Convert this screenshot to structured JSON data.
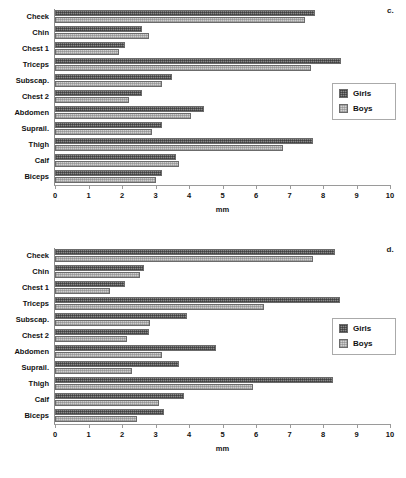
{
  "figure": {
    "panels": [
      {
        "letter": "c.",
        "chart_data": {
          "type": "bar",
          "orientation": "horizontal",
          "title": "",
          "xlabel": "mm",
          "ylabel": "",
          "xlim": [
            0,
            10
          ],
          "xticks": [
            "0",
            "1",
            "2",
            "3",
            "4",
            "5",
            "6",
            "7",
            "8",
            "9",
            "10"
          ],
          "grid": false,
          "legend_position": "right",
          "categories": [
            "Cheek",
            "Chin",
            "Chest 1",
            "Triceps",
            "Subscap.",
            "Chest 2",
            "Abdomen",
            "Suprail.",
            "Thigh",
            "Calf",
            "Biceps"
          ],
          "series": [
            {
              "name": "Girls",
              "values": [
                7.75,
                2.6,
                2.1,
                8.55,
                3.5,
                2.6,
                4.45,
                3.2,
                7.7,
                3.6,
                3.2
              ]
            },
            {
              "name": "Boys",
              "values": [
                7.45,
                2.8,
                1.9,
                7.65,
                3.2,
                2.2,
                4.05,
                2.9,
                6.8,
                3.7,
                3.0
              ]
            }
          ]
        }
      },
      {
        "letter": "d.",
        "chart_data": {
          "type": "bar",
          "orientation": "horizontal",
          "title": "",
          "xlabel": "mm",
          "ylabel": "",
          "xlim": [
            0,
            10
          ],
          "xticks": [
            "0",
            "1",
            "2",
            "3",
            "4",
            "5",
            "6",
            "7",
            "8",
            "9",
            "10"
          ],
          "grid": false,
          "legend_position": "right",
          "categories": [
            "Cheek",
            "Chin",
            "Chest 1",
            "Triceps",
            "Subscap.",
            "Chest 2",
            "Abdomen",
            "Suprail.",
            "Thigh",
            "Calf",
            "Biceps"
          ],
          "series": [
            {
              "name": "Girls",
              "values": [
                8.35,
                2.65,
                2.1,
                8.5,
                3.95,
                2.8,
                4.8,
                3.7,
                8.3,
                3.85,
                3.25
              ]
            },
            {
              "name": "Boys",
              "values": [
                7.7,
                2.55,
                1.65,
                6.25,
                2.85,
                2.15,
                3.2,
                2.3,
                5.9,
                3.1,
                2.45
              ]
            }
          ]
        }
      }
    ],
    "legend": {
      "girls_label": "Girls",
      "boys_label": "Boys"
    },
    "colors": {
      "girls": "#8a8a8a",
      "boys": "#cfcfcf",
      "axis": "#9a9a9a",
      "text": "#111111"
    }
  }
}
